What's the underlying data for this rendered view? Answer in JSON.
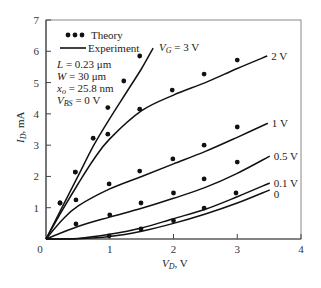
{
  "chart_data": {
    "type": "line",
    "title": "",
    "xlabel": "V_D, V",
    "ylabel": "I_D, mA",
    "xlim": [
      0,
      4
    ],
    "ylim": [
      0,
      7
    ],
    "x_ticks": [
      "0",
      "1",
      "2",
      "3",
      "4"
    ],
    "y_ticks": [
      "1",
      "2",
      "3",
      "4",
      "5",
      "6",
      "7"
    ],
    "grid": false,
    "legend": {
      "position": "top-left",
      "entries": [
        {
          "label": "Theory",
          "style": "dots"
        },
        {
          "label": "Experiment",
          "style": "line"
        }
      ]
    },
    "annotation": {
      "lines": [
        {
          "text": "L = 0.23 μm"
        },
        {
          "text": "W = 30 μm"
        },
        {
          "text": "x_o = 25.8 nm"
        },
        {
          "text": "V_BS = 0 V"
        }
      ]
    },
    "series": [
      {
        "name": "V_G = 3 V",
        "label": "V_G = 3 V",
        "experiment": [
          [
            0,
            0
          ],
          [
            0.25,
            1.0
          ],
          [
            0.5,
            2.0
          ],
          [
            0.75,
            3.0
          ],
          [
            1.0,
            3.85
          ],
          [
            1.25,
            4.65
          ],
          [
            1.5,
            5.45
          ],
          [
            1.68,
            6.1
          ]
        ],
        "theory": [
          [
            0.22,
            1.15
          ],
          [
            0.46,
            2.14
          ],
          [
            0.74,
            3.22
          ],
          [
            0.97,
            4.2
          ],
          [
            1.22,
            5.05
          ],
          [
            1.47,
            5.85
          ]
        ]
      },
      {
        "name": "V_G = 2 V",
        "label": "2 V",
        "experiment": [
          [
            0,
            0
          ],
          [
            0.25,
            0.9
          ],
          [
            0.5,
            1.75
          ],
          [
            0.75,
            2.55
          ],
          [
            1.0,
            3.2
          ],
          [
            1.5,
            4.1
          ],
          [
            2.0,
            4.6
          ],
          [
            2.5,
            5.0
          ],
          [
            3.0,
            5.45
          ],
          [
            3.47,
            5.85
          ]
        ],
        "theory": [
          [
            0.22,
            1.15
          ],
          [
            0.46,
            2.14
          ],
          [
            0.97,
            3.35
          ],
          [
            1.47,
            4.15
          ],
          [
            1.98,
            4.76
          ],
          [
            2.48,
            5.27
          ],
          [
            3.0,
            5.72
          ]
        ]
      },
      {
        "name": "V_G = 1 V",
        "label": "1 V",
        "experiment": [
          [
            0,
            0
          ],
          [
            0.25,
            0.6
          ],
          [
            0.5,
            1.05
          ],
          [
            1.0,
            1.6
          ],
          [
            1.5,
            2.0
          ],
          [
            2.0,
            2.4
          ],
          [
            2.5,
            2.8
          ],
          [
            3.0,
            3.25
          ],
          [
            3.48,
            3.7
          ]
        ],
        "theory": [
          [
            0.47,
            1.25
          ],
          [
            0.99,
            1.76
          ],
          [
            1.47,
            2.17
          ],
          [
            1.99,
            2.56
          ],
          [
            2.48,
            3.0
          ],
          [
            3.0,
            3.58
          ]
        ]
      },
      {
        "name": "V_G = 0.5 V",
        "label": "0.5 V",
        "experiment": [
          [
            0,
            0
          ],
          [
            0.5,
            0.4
          ],
          [
            1.0,
            0.7
          ],
          [
            1.5,
            0.98
          ],
          [
            2.0,
            1.3
          ],
          [
            2.5,
            1.65
          ],
          [
            3.0,
            2.1
          ],
          [
            3.51,
            2.65
          ]
        ],
        "theory": [
          [
            0.47,
            0.48
          ],
          [
            1.0,
            0.77
          ],
          [
            1.49,
            1.15
          ],
          [
            2.0,
            1.47
          ],
          [
            2.48,
            1.92
          ],
          [
            3.0,
            2.46
          ]
        ]
      },
      {
        "name": "V_G = 0.1 V",
        "label": "0.1 V",
        "experiment": [
          [
            0,
            0
          ],
          [
            0.5,
            0.02
          ],
          [
            1.0,
            0.15
          ],
          [
            1.5,
            0.35
          ],
          [
            2.0,
            0.65
          ],
          [
            2.5,
            0.95
          ],
          [
            3.0,
            1.35
          ],
          [
            3.51,
            1.79
          ]
        ],
        "theory": [
          [
            0.99,
            0.1
          ],
          [
            1.49,
            0.32
          ],
          [
            2.0,
            0.58
          ],
          [
            2.48,
            0.99
          ],
          [
            2.98,
            1.47
          ]
        ]
      },
      {
        "name": "V_G = 0 V",
        "label": "0",
        "experiment": [
          [
            0,
            0
          ],
          [
            0.5,
            0.01
          ],
          [
            1.0,
            0.08
          ],
          [
            1.5,
            0.25
          ],
          [
            2.0,
            0.5
          ],
          [
            2.5,
            0.8
          ],
          [
            3.0,
            1.15
          ],
          [
            3.51,
            1.57
          ]
        ],
        "theory": []
      }
    ]
  },
  "labels": {
    "legend_theory": "Theory",
    "legend_experiment": "Experiment",
    "param_L": "= 0.23 μm",
    "param_W": "= 30 μm",
    "param_xo": "= 25.8 nm",
    "param_VBS": "= 0 V",
    "x_axis_unit": ", V",
    "y_axis_unit": ", mA",
    "origin": "0"
  }
}
